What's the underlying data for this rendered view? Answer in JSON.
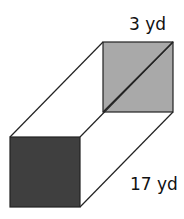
{
  "diagram": {
    "type": "rectangular prism (square cross-section)",
    "labels": {
      "side": "3 yd",
      "length": "17 yd"
    },
    "colors": {
      "back_face": "#a9a9a9",
      "front_face": "#3f3f3f",
      "edges": "#222222",
      "background": "#ffffff"
    },
    "geometry": {
      "back_square": {
        "x": 103,
        "y": 42,
        "size": 70
      },
      "front_square": {
        "x": 10,
        "y": 137,
        "size": 70
      }
    }
  }
}
